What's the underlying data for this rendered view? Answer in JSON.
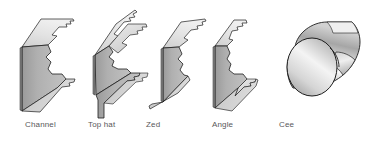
{
  "figure": {
    "background_color": "#ffffff",
    "width": 378,
    "height": 141,
    "label_color": "#58585a",
    "outline_color": "#1d1d1d",
    "face_colors": {
      "top_light": "#d9d9d9",
      "front_mid": "#a9a9a9",
      "front_dark": "#8f8f8f",
      "edge_pale": "#e6e6e6",
      "highlight": "#f7f7f7"
    }
  },
  "profiles": [
    {
      "id": "channel",
      "label": "Channel",
      "label_x": 25,
      "icon_name": "channel-profile-icon",
      "description": "C shaped cold formed steel section shown in isometric view"
    },
    {
      "id": "top-hat",
      "label": "Top hat",
      "label_x": 88,
      "icon_name": "top-hat-profile-icon",
      "description": "Top hat shaped cold formed steel section shown in isometric view"
    },
    {
      "id": "zed",
      "label": "Zed",
      "label_x": 146,
      "icon_name": "zed-profile-icon",
      "description": "Z shaped cold formed steel section shown in isometric view"
    },
    {
      "id": "angle",
      "label": "Angle",
      "label_x": 212,
      "icon_name": "angle-profile-icon",
      "description": "L shaped angle steel section shown in isometric view"
    },
    {
      "id": "cee",
      "label": "Cee",
      "label_x": 279,
      "icon_name": "cee-profile-icon",
      "description": "Rolled circular cee section tube shown in isometric view"
    }
  ]
}
